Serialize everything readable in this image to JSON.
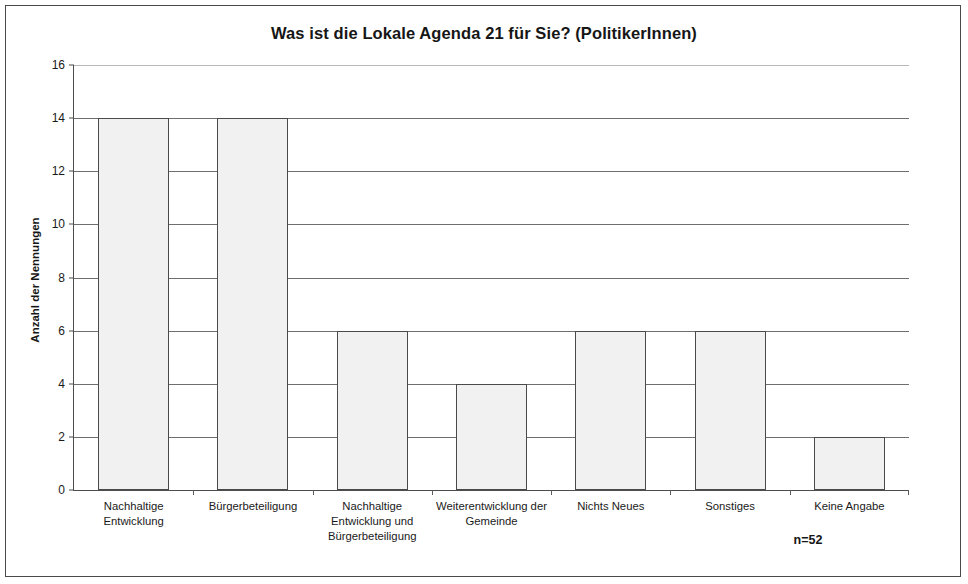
{
  "figure": {
    "n_annotation": "n=52"
  },
  "chart_data": {
    "type": "bar",
    "title": "Was ist die Lokale Agenda 21 für Sie? (PolitikerInnen)",
    "xlabel": "",
    "ylabel": "Anzahl der Nennungen",
    "categories": [
      "Nachhaltige Entwicklung",
      "Bürgerbeteiligung",
      "Nachhaltige Entwicklung und Bürgerbeteiligung",
      "Weiterentwicklung der Gemeinde",
      "Nichts Neues",
      "Sonstiges",
      "Keine Angabe"
    ],
    "values": [
      14,
      14,
      6,
      4,
      6,
      6,
      2
    ],
    "ylim": [
      0,
      16
    ],
    "ytick_labels": [
      "0",
      "2",
      "4",
      "6",
      "8",
      "10",
      "12",
      "14",
      "16"
    ],
    "ytick_values": [
      0,
      2,
      4,
      6,
      8,
      10,
      12,
      14,
      16
    ],
    "grid": true,
    "legend": false,
    "bar_fill_color": "#f1f1f1",
    "bar_border_color": "#4a4a4a",
    "axis_color": "#4d4d4d",
    "gridline_color": "#6e6e6e",
    "annotations": [
      "n=52"
    ]
  }
}
